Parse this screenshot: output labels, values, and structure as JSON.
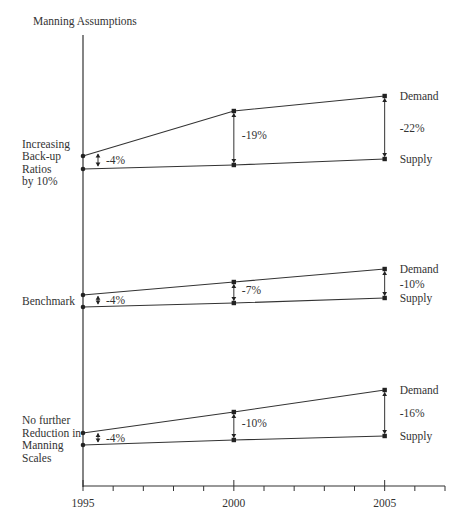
{
  "chart_data": {
    "type": "line",
    "title": "Manning Assumptions",
    "xlabel": "",
    "ylabel": "Manning Assumptions",
    "x": [
      1995,
      2000,
      2005
    ],
    "x_tick_labels": [
      "1995",
      "2000",
      "2005"
    ],
    "x_range": [
      1995,
      2007
    ],
    "grid": false,
    "series_labels": {
      "demand": "Demand",
      "supply": "Supply"
    },
    "scenarios": [
      {
        "name": "Increasing Back-up Ratios by 10%",
        "label_lines": [
          "Increasing",
          "Back-up",
          "Ratios",
          "by 10%"
        ],
        "gaps": [
          "-4%",
          "-19%",
          "-22%"
        ],
        "demand_px_y": [
          156,
          111,
          96
        ],
        "supply_px_y": [
          169,
          165,
          159
        ]
      },
      {
        "name": "Benchmark",
        "label_lines": [
          "Benchmark"
        ],
        "gaps": [
          "-4%",
          "-7%",
          "-10%"
        ],
        "demand_px_y": [
          295,
          282,
          269
        ],
        "supply_px_y": [
          307,
          303,
          298
        ]
      },
      {
        "name": "No further Reduction in Manning Scales",
        "label_lines": [
          "No further",
          "Reduction in",
          "Manning",
          "Scales"
        ],
        "gaps": [
          "-4%",
          "-10%",
          "-16%"
        ],
        "demand_px_y": [
          433,
          412,
          390
        ],
        "supply_px_y": [
          445,
          440,
          436
        ]
      }
    ]
  }
}
